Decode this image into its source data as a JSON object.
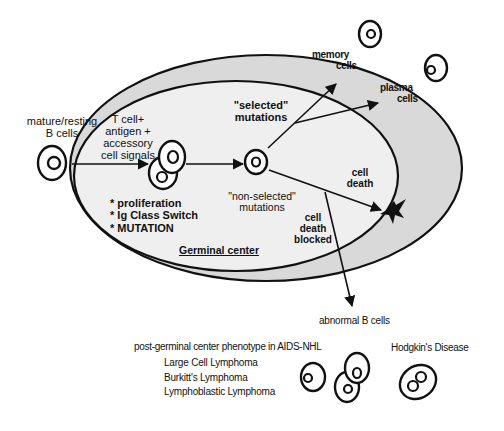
{
  "diagram": {
    "regions": {
      "germinal_center": "Germinal center",
      "outer_zone_fill": "#d9d9d9",
      "inner_zone_fill": "#efefef",
      "stroke": "#111111"
    },
    "entry": {
      "label_line1": "mature/resting",
      "label_line2": "B cells"
    },
    "activation": {
      "line1": "T cell+",
      "line2": "antigen +",
      "line3": "accessory",
      "line4": "cell signals"
    },
    "processes": [
      "* proliferation",
      "* Ig Class Switch",
      "* MUTATION"
    ],
    "selected": {
      "line1": "\"selected\"",
      "line2": "mutations"
    },
    "non_selected": {
      "line1": "\"non-selected\"",
      "line2": "mutations"
    },
    "outcomes": {
      "memory_line1": "memory",
      "memory_line2": "cells",
      "plasma_line1": "plasma",
      "plasma_line2": "cells",
      "death_line1": "cell",
      "death_line2": "death",
      "blocked_line1": "cell",
      "blocked_line2": "death",
      "blocked_line3": "blocked",
      "abnormal": "abnormal B cells"
    },
    "phenotypes": {
      "heading": "post-germinal center phenotype in AIDS-NHL",
      "items": [
        "Large Cell Lymphoma",
        "Burkitt's Lymphoma",
        "Lymphoblastic Lymphoma"
      ],
      "hodgkin": "Hodgkin's Disease"
    },
    "icons": {
      "cell": "concentric-oval-cell",
      "dividing_cell": "overlapping-cells",
      "death": "black-four-point-star",
      "reed_sternberg": "binucleate-cell"
    }
  }
}
